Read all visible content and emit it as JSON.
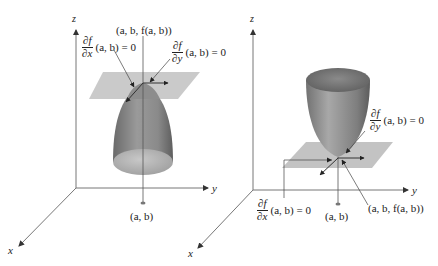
{
  "figure": {
    "left_panel": {
      "description": "Local maximum: downward-opening surface with horizontal tangent plane at the top point",
      "axes": {
        "z": "z",
        "y": "y",
        "x": "x"
      },
      "point_label": "(a, b, f(a, b))",
      "base_point_label": "(a, b)",
      "partial_x": {
        "numerator": "∂f",
        "denominator": "∂x",
        "rhs": "(a, b) = 0"
      },
      "partial_y": {
        "numerator": "∂f",
        "denominator": "∂y",
        "rhs": "(a, b) = 0"
      }
    },
    "right_panel": {
      "description": "Local minimum: upward-opening surface with horizontal tangent plane at the bottom point",
      "axes": {
        "z": "z",
        "y": "y",
        "x": "x"
      },
      "point_label": "(a, b, f(a, b))",
      "base_point_label": "(a, b)",
      "partial_x": {
        "numerator": "∂f",
        "denominator": "∂x",
        "rhs": "(a, b) = 0"
      },
      "partial_y": {
        "numerator": "∂f",
        "denominator": "∂y",
        "rhs": "(a, b) = 0"
      }
    },
    "colors": {
      "axis": "#777777",
      "surface_dark": "#6e6e6e",
      "surface_light": "#bdbdbd",
      "plane": "#b4b4b4",
      "text": "#222222"
    }
  }
}
